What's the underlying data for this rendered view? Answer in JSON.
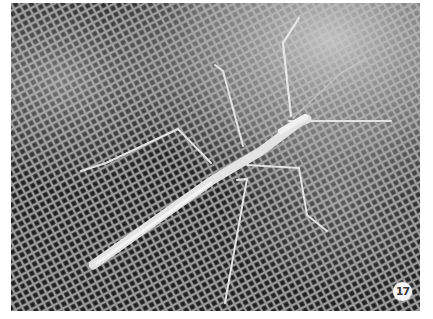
{
  "image": {
    "subject": "stick insect on window mesh screen",
    "description": "Pale, slender stick insect with long thin legs and antennae resting diagonally on a dark woven insect screen, grayscale photograph",
    "colors": {
      "mesh_dark": "#2a2a2a",
      "mesh_light": "#8a8a8a",
      "insect": "#e6e6e6",
      "haze": "#bdbdbd",
      "border": "#ffffff"
    }
  },
  "badge": {
    "label": "17"
  }
}
